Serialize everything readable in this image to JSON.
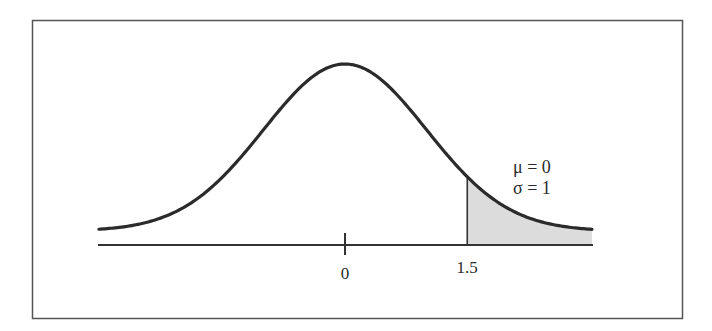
{
  "figure": {
    "type": "normal_distribution_diagram",
    "colors": {
      "frame": "#555555",
      "curve": "#2b2b2b",
      "axis": "#333333",
      "shade": "#dcdcdc",
      "background": "#ffffff"
    }
  },
  "params": {
    "mu_label": "μ = 0",
    "sigma_label": "σ = 1",
    "mu": 0,
    "sigma": 1
  },
  "axis": {
    "ticks": [
      {
        "value": 0,
        "label": "0"
      },
      {
        "value": 1.5,
        "label": "1.5"
      }
    ]
  },
  "shaded_region": {
    "from": 1.5,
    "to": "right tail",
    "description": "upper tail area beyond z = 1.5"
  },
  "chart_data": {
    "type": "area",
    "title": "",
    "xlabel": "",
    "ylabel": "",
    "distribution": "normal",
    "mu": 0,
    "sigma": 1,
    "x_range": [
      -3,
      3
    ],
    "tick_labels": [
      "0",
      "1.5"
    ],
    "tick_values": [
      0,
      1.5
    ],
    "shaded_interval": [
      1.5,
      3
    ],
    "annotations": [
      "μ = 0",
      "σ = 1"
    ],
    "grid": false,
    "legend": "none"
  }
}
